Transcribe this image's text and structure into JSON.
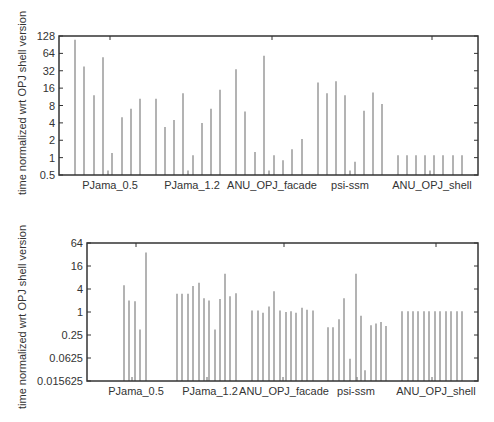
{
  "chart_data": [
    {
      "type": "bar",
      "title": "",
      "xlabel": "",
      "ylabel": "time normalized wrt OPJ shell version",
      "yscale": "log2",
      "ylim": [
        0.5,
        128
      ],
      "yticks": [
        "128",
        "64",
        "32",
        "16",
        "8",
        "4",
        "2",
        "1",
        "0.5"
      ],
      "grid": false,
      "legend": "none",
      "categories": [
        "PJama_0.5",
        "PJama_1.2",
        "ANU_OPJ_facade",
        "psi-ssm",
        "ANU_OPJ_shell"
      ],
      "category_x": [
        110,
        192,
        272,
        350,
        432
      ],
      "bars": [
        {
          "x": 75,
          "value": 110
        },
        {
          "x": 84,
          "value": 38
        },
        {
          "x": 94,
          "value": 12
        },
        {
          "x": 103,
          "value": 55
        },
        {
          "x": 108,
          "value": 0.6
        },
        {
          "x": 112,
          "value": 1.2
        },
        {
          "x": 122,
          "value": 5
        },
        {
          "x": 131,
          "value": 7
        },
        {
          "x": 140,
          "value": 10.5
        },
        {
          "x": 156,
          "value": 10.5
        },
        {
          "x": 165,
          "value": 3.4
        },
        {
          "x": 174,
          "value": 4.5
        },
        {
          "x": 183,
          "value": 13
        },
        {
          "x": 188,
          "value": 0.6
        },
        {
          "x": 193,
          "value": 1.1
        },
        {
          "x": 202,
          "value": 4
        },
        {
          "x": 211,
          "value": 7
        },
        {
          "x": 220,
          "value": 15
        },
        {
          "x": 236,
          "value": 34
        },
        {
          "x": 245,
          "value": 6.3
        },
        {
          "x": 255,
          "value": 1.25
        },
        {
          "x": 264,
          "value": 58
        },
        {
          "x": 269,
          "value": 0.6
        },
        {
          "x": 274,
          "value": 1.1
        },
        {
          "x": 283,
          "value": 0.9
        },
        {
          "x": 292,
          "value": 1.4
        },
        {
          "x": 302,
          "value": 2.1
        },
        {
          "x": 318,
          "value": 20
        },
        {
          "x": 327,
          "value": 13
        },
        {
          "x": 336,
          "value": 21
        },
        {
          "x": 345,
          "value": 12
        },
        {
          "x": 350,
          "value": 0.6
        },
        {
          "x": 355,
          "value": 0.85
        },
        {
          "x": 364,
          "value": 6.5
        },
        {
          "x": 373,
          "value": 13.5
        },
        {
          "x": 382,
          "value": 8.5
        },
        {
          "x": 398,
          "value": 1.1
        },
        {
          "x": 407,
          "value": 1.1
        },
        {
          "x": 416,
          "value": 1.1
        },
        {
          "x": 425,
          "value": 1.1
        },
        {
          "x": 430,
          "value": 0.6
        },
        {
          "x": 434,
          "value": 1.1
        },
        {
          "x": 443,
          "value": 1.1
        },
        {
          "x": 453,
          "value": 1.1
        },
        {
          "x": 462,
          "value": 1.1
        }
      ]
    },
    {
      "type": "bar",
      "title": "",
      "xlabel": "",
      "ylabel": "time normalized wrt OPJ shell version",
      "yscale": "log4",
      "ylim": [
        0.015625,
        64
      ],
      "yticks": [
        "64",
        "16",
        "4",
        "1",
        "0.25",
        "0.0625",
        "0.015625"
      ],
      "grid": false,
      "legend": "none",
      "categories": [
        "PJama_0.5",
        "PJama_1.2",
        "ANU_OPJ_facade",
        "psi-ssm",
        "ANU_OPJ_shell"
      ],
      "category_x": [
        136,
        210,
        284,
        356,
        436
      ],
      "bars": [
        {
          "x": 124,
          "value": 5
        },
        {
          "x": 129,
          "value": 2
        },
        {
          "x": 132,
          "value": 0.02
        },
        {
          "x": 135,
          "value": 1.9
        },
        {
          "x": 140,
          "value": 0.35
        },
        {
          "x": 146,
          "value": 36
        },
        {
          "x": 177,
          "value": 3
        },
        {
          "x": 182,
          "value": 3
        },
        {
          "x": 188,
          "value": 3
        },
        {
          "x": 193,
          "value": 4.8
        },
        {
          "x": 199,
          "value": 5.8
        },
        {
          "x": 204,
          "value": 2.3
        },
        {
          "x": 207,
          "value": 0.02
        },
        {
          "x": 209,
          "value": 2
        },
        {
          "x": 215,
          "value": 0.35
        },
        {
          "x": 220,
          "value": 2.2
        },
        {
          "x": 225,
          "value": 10
        },
        {
          "x": 230,
          "value": 2.6
        },
        {
          "x": 236,
          "value": 3.1
        },
        {
          "x": 252,
          "value": 1.1
        },
        {
          "x": 258,
          "value": 1.1
        },
        {
          "x": 263,
          "value": 0.95
        },
        {
          "x": 269,
          "value": 1.4
        },
        {
          "x": 274,
          "value": 3.5
        },
        {
          "x": 280,
          "value": 1.1
        },
        {
          "x": 283,
          "value": 0.02
        },
        {
          "x": 286,
          "value": 1
        },
        {
          "x": 291,
          "value": 1.05
        },
        {
          "x": 296,
          "value": 0.95
        },
        {
          "x": 302,
          "value": 1.3
        },
        {
          "x": 307,
          "value": 1.15
        },
        {
          "x": 313,
          "value": 1.1
        },
        {
          "x": 328,
          "value": 0.4
        },
        {
          "x": 333,
          "value": 0.4
        },
        {
          "x": 339,
          "value": 0.65
        },
        {
          "x": 344,
          "value": 2.3
        },
        {
          "x": 350,
          "value": 0.06
        },
        {
          "x": 356,
          "value": 10
        },
        {
          "x": 357,
          "value": 0.02
        },
        {
          "x": 361,
          "value": 0.8
        },
        {
          "x": 365,
          "value": 0.03
        },
        {
          "x": 371,
          "value": 0.45
        },
        {
          "x": 376,
          "value": 0.5
        },
        {
          "x": 381,
          "value": 0.55
        },
        {
          "x": 386,
          "value": 0.43
        },
        {
          "x": 402,
          "value": 1.05
        },
        {
          "x": 408,
          "value": 1.05
        },
        {
          "x": 413,
          "value": 1.05
        },
        {
          "x": 418,
          "value": 1.05
        },
        {
          "x": 424,
          "value": 1.05
        },
        {
          "x": 429,
          "value": 1.05
        },
        {
          "x": 432,
          "value": 0.02
        },
        {
          "x": 435,
          "value": 1.05
        },
        {
          "x": 440,
          "value": 1.05
        },
        {
          "x": 446,
          "value": 1.05
        },
        {
          "x": 451,
          "value": 1.05
        },
        {
          "x": 457,
          "value": 1.05
        },
        {
          "x": 462,
          "value": 1.05
        }
      ]
    }
  ],
  "charts": {
    "top": {
      "ylabel": "time normalized wrt OPJ shell version",
      "yticks": [
        "128",
        "64",
        "32",
        "16",
        "8",
        "4",
        "2",
        "1",
        "0.5"
      ],
      "categories": [
        "PJama_0.5",
        "PJama_1.2",
        "ANU_OPJ_facade",
        "psi-ssm",
        "ANU_OPJ_shell"
      ]
    },
    "bottom": {
      "ylabel": "time normalized wrt OPJ shell version",
      "yticks": [
        "64",
        "16",
        "4",
        "1",
        "0.25",
        "0.0625",
        "0.015625"
      ],
      "categories": [
        "PJama_0.5",
        "PJama_1.2",
        "ANU_OPJ_facade",
        "psi-ssm",
        "ANU_OPJ_shell"
      ]
    }
  },
  "colors": {
    "bar": "#808080",
    "axis": "#333333"
  }
}
